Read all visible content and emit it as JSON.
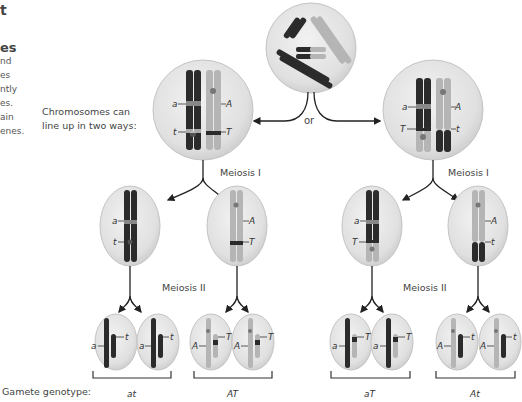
{
  "sidebar": {
    "heading_fragment": "t",
    "subheading_fragment": "es",
    "lines": [
      "nd",
      "es",
      "ntly",
      "es.",
      "ain",
      "enes."
    ]
  },
  "diagram": {
    "lineup_note": [
      "Chromosomes can",
      "line up in two ways:"
    ],
    "or_label": "or",
    "meiosis_1_label": "Meiosis I",
    "meiosis_2_label": "Meiosis II",
    "gamete_genotype_label": "Gamete genotype:",
    "arrangement_left": {
      "alleles": {
        "dark_top": "a",
        "light_top": "A",
        "dark_bottom": "t",
        "light_bottom": "T"
      },
      "meiosis1_cells": [
        {
          "alleles": [
            "a",
            "t"
          ],
          "shade": "dark"
        },
        {
          "alleles": [
            "A",
            "T"
          ],
          "shade": "light"
        }
      ],
      "gametes": [
        {
          "genotype": "at",
          "cells": [
            [
              "a",
              "t"
            ],
            [
              "a",
              "t"
            ]
          ]
        },
        {
          "genotype": "AT",
          "cells": [
            [
              "A",
              "T"
            ],
            [
              "A",
              "T"
            ]
          ]
        }
      ]
    },
    "arrangement_right": {
      "alleles": {
        "dark_top": "a",
        "light_top": "A",
        "light_bottom": "T",
        "dark_bottom": "t"
      },
      "meiosis1_cells": [
        {
          "alleles": [
            "a",
            "T"
          ],
          "shade": "mixed"
        },
        {
          "alleles": [
            "A",
            "t"
          ],
          "shade": "mixed"
        }
      ],
      "gametes": [
        {
          "genotype": "aT",
          "cells": [
            [
              "a",
              "T"
            ],
            [
              "a",
              "T"
            ]
          ]
        },
        {
          "genotype": "At",
          "cells": [
            [
              "A",
              "t"
            ],
            [
              "A",
              "t"
            ]
          ]
        }
      ]
    },
    "colors": {
      "dark_chromosome": "#2b2b2b",
      "light_chromosome": "#b5b5b5",
      "cell_fill": "#e3e3e3",
      "cell_edge": "#c4c4c4",
      "arrow": "#222222"
    }
  }
}
